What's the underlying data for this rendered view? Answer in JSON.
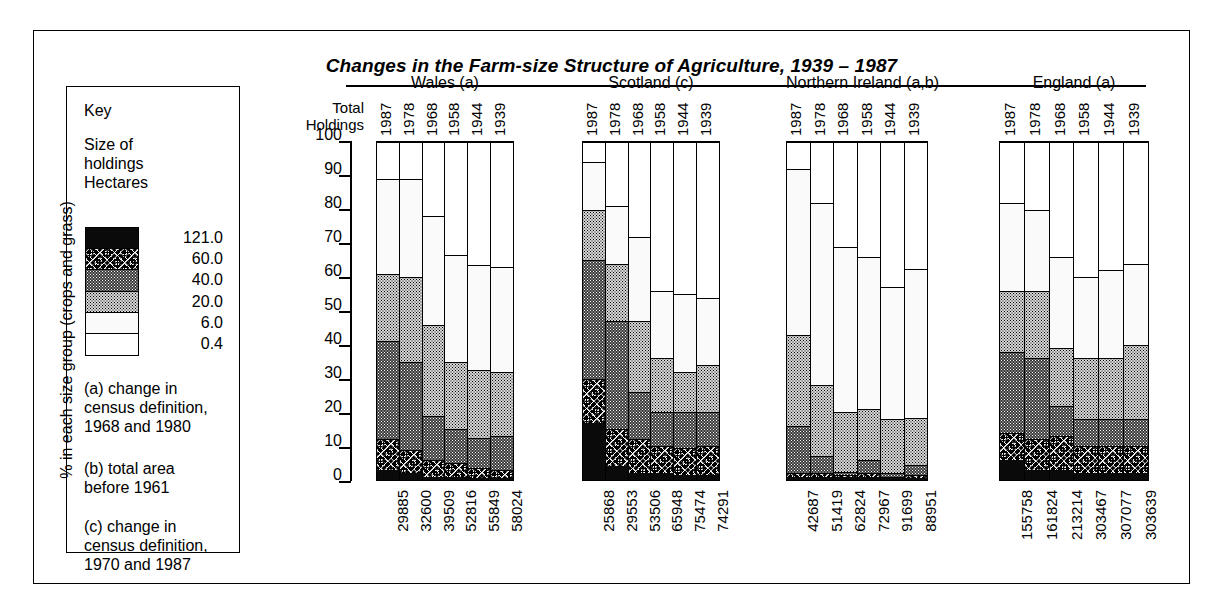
{
  "title": "Changes in the Farm-size Structure of Agriculture, 1939 – 1987",
  "key": {
    "heading": "Key",
    "subheading": "Size of\nholdings\nHectares",
    "labels": [
      "121.0",
      "60.0",
      "40.0",
      "20.0",
      "6.0",
      "0.4"
    ],
    "notes": {
      "a": "(a) change in\ncensus definition,\n1968 and 1980",
      "b": "(b) total area\nbefore 1961",
      "c": "(c) change in\ncensus definition,\n1970 and 1987"
    }
  },
  "axis": {
    "ylabel": "% in each size group (crops and grass)",
    "total_holdings_label": "Total\nHoldings",
    "yticks": [
      "100",
      "90",
      "80",
      "70",
      "60",
      "50",
      "40",
      "30",
      "20",
      "10",
      "0"
    ]
  },
  "chart_data": {
    "type": "bar",
    "title": "Changes in the Farm-size Structure of Agriculture, 1939 – 1987",
    "subtype": "stacked-100-percent",
    "xlabel": "",
    "ylabel": "% in each size group (crops and grass)",
    "ylim": [
      0,
      100
    ],
    "grid": false,
    "legend_position": "left-key-box",
    "series_names": [
      "121.0",
      "60.0",
      "40.0",
      "20.0",
      "6.0",
      "0.4"
    ],
    "series_order_bottom_to_top": [
      "121.0",
      "60.0",
      "40.0",
      "20.0",
      "6.0",
      "0.4"
    ],
    "panels": [
      {
        "name": "Wales (a)",
        "categories": [
          "1987",
          "1978",
          "1968",
          "1958",
          "1944",
          "1939"
        ],
        "total_holdings": [
          "29885",
          "32600",
          "39509",
          "52816",
          "55849",
          "58024"
        ],
        "series": [
          {
            "name": "121.0",
            "values": [
              3.0,
              2.0,
              1.0,
              1.0,
              0.5,
              0.5
            ]
          },
          {
            "name": "60.0",
            "values": [
              9.0,
              7.0,
              5.0,
              4.0,
              3.0,
              2.5
            ]
          },
          {
            "name": "40.0",
            "values": [
              29.0,
              26.0,
              13.0,
              10.0,
              9.0,
              10.0
            ]
          },
          {
            "name": "20.0",
            "values": [
              20.0,
              25.0,
              27.0,
              20.0,
              20.0,
              19.0
            ]
          },
          {
            "name": "6.0",
            "values": [
              28.0,
              29.0,
              32.0,
              31.5,
              31.0,
              31.0
            ]
          },
          {
            "name": "0.4",
            "values": [
              11.0,
              11.0,
              22.0,
              33.5,
              36.5,
              37.0
            ]
          }
        ]
      },
      {
        "name": "Scotland (c)",
        "categories": [
          "1987",
          "1978",
          "1968",
          "1958",
          "1944",
          "1939"
        ],
        "total_holdings": [
          "25868",
          "29553",
          "53506",
          "65948",
          "75474",
          "74291"
        ],
        "series": [
          {
            "name": "121.0",
            "values": [
              17.0,
              4.0,
              2.0,
              2.0,
              1.5,
              1.5
            ]
          },
          {
            "name": "60.0",
            "values": [
              13.0,
              11.0,
              10.0,
              8.0,
              8.0,
              8.5
            ]
          },
          {
            "name": "40.0",
            "values": [
              35.0,
              32.0,
              14.0,
              10.0,
              10.5,
              10.0
            ]
          },
          {
            "name": "20.0",
            "values": [
              15.0,
              17.0,
              21.0,
              16.0,
              12.0,
              14.0
            ]
          },
          {
            "name": "6.0",
            "values": [
              14.0,
              17.0,
              25.0,
              20.0,
              23.0,
              20.0
            ]
          },
          {
            "name": "0.4",
            "values": [
              6.0,
              19.0,
              28.0,
              44.0,
              45.0,
              46.0
            ]
          }
        ]
      },
      {
        "name": "Northern Ireland (a,b)",
        "categories": [
          "1987",
          "1978",
          "1968",
          "1958",
          "1944",
          "1939"
        ],
        "total_holdings": [
          "42687",
          "51419",
          "62824",
          "72967",
          "91699",
          "88951"
        ],
        "series": [
          {
            "name": "121.0",
            "values": [
              1.0,
              1.0,
              1.0,
              1.0,
              0.5,
              0.5
            ]
          },
          {
            "name": "60.0",
            "values": [
              1.0,
              1.0,
              0.5,
              1.0,
              0.5,
              1.0
            ]
          },
          {
            "name": "40.0",
            "values": [
              14.0,
              5.0,
              1.0,
              4.0,
              1.0,
              3.0
            ]
          },
          {
            "name": "20.0",
            "values": [
              27.0,
              21.0,
              17.5,
              15.0,
              16.0,
              14.0
            ]
          },
          {
            "name": "6.0",
            "values": [
              49.0,
              54.0,
              49.0,
              45.0,
              39.0,
              44.0
            ]
          },
          {
            "name": "0.4",
            "values": [
              8.0,
              18.0,
              31.0,
              34.0,
              43.0,
              37.5
            ]
          }
        ]
      },
      {
        "name": "England (a)",
        "categories": [
          "1987",
          "1978",
          "1968",
          "1958",
          "1944",
          "1939"
        ],
        "total_holdings": [
          "155758",
          "161824",
          "213214",
          "303467",
          "307077",
          "303639"
        ],
        "series": [
          {
            "name": "121.0",
            "values": [
              6.0,
              3.0,
              3.0,
              2.0,
              2.0,
              2.0
            ]
          },
          {
            "name": "60.0",
            "values": [
              8.0,
              9.0,
              10.0,
              8.0,
              8.0,
              8.0
            ]
          },
          {
            "name": "40.0",
            "values": [
              24.0,
              24.0,
              9.0,
              8.0,
              8.0,
              8.0
            ]
          },
          {
            "name": "20.0",
            "values": [
              18.0,
              20.0,
              17.0,
              18.0,
              18.0,
              22.0
            ]
          },
          {
            "name": "6.0",
            "values": [
              26.0,
              24.0,
              27.0,
              24.0,
              26.0,
              24.0
            ]
          },
          {
            "name": "0.4",
            "values": [
              18.0,
              20.0,
              34.0,
              40.0,
              38.0,
              36.0
            ]
          }
        ]
      }
    ]
  }
}
